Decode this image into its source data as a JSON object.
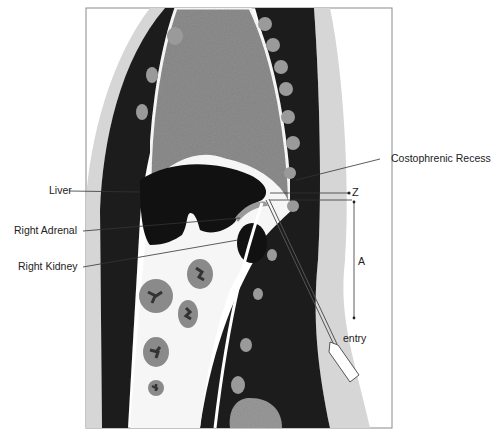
{
  "figure": {
    "type": "sagittal anatomical diagram",
    "labels": {
      "liver": "Liver",
      "right_adrenal": "Right Adrenal",
      "right_kidney": "Right Kidney",
      "costophrenic_recess": "Costophrenic Recess",
      "z": "Z",
      "a": "A",
      "entry": "entry"
    },
    "colors": {
      "background": "#ffffff",
      "frame": "#8a8a8a",
      "muscle_dark": "#1e1e1e",
      "lung_gray": "#8e8e8e",
      "skin_light": "#d6d6d6",
      "organ_dark": "#111111",
      "fat_white": "#f6f6f6",
      "bowel_gray": "#8a8a8a",
      "rib_gray": "#9a9a9a",
      "leader_line": "#333333"
    }
  }
}
